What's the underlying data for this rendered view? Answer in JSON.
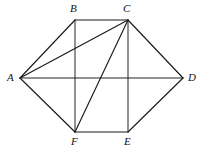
{
  "figure": {
    "name": "hexagon-with-diagonals",
    "width": 202,
    "height": 153,
    "background_color": "#ffffff",
    "stroke_color": "#1a1a1a",
    "vertices": [
      {
        "id": "A",
        "label": "A",
        "x": 20,
        "y": 78,
        "label_x": 7,
        "label_y": 72
      },
      {
        "id": "B",
        "label": "B",
        "x": 75,
        "y": 20,
        "label_x": 70,
        "label_y": 3
      },
      {
        "id": "C",
        "label": "C",
        "x": 128,
        "y": 20,
        "label_x": 123,
        "label_y": 3
      },
      {
        "id": "D",
        "label": "D",
        "x": 183,
        "y": 78,
        "label_x": 188,
        "label_y": 72
      },
      {
        "id": "E",
        "label": "E",
        "x": 128,
        "y": 132,
        "label_x": 124,
        "label_y": 136
      },
      {
        "id": "F",
        "label": "F",
        "x": 75,
        "y": 132,
        "label_x": 71,
        "label_y": 136
      }
    ],
    "edges": [
      {
        "id": "AB",
        "from": "A",
        "to": "B",
        "weight": "normal"
      },
      {
        "id": "BC",
        "from": "B",
        "to": "C",
        "weight": "normal"
      },
      {
        "id": "CD",
        "from": "C",
        "to": "D",
        "weight": "normal"
      },
      {
        "id": "DE",
        "from": "D",
        "to": "E",
        "weight": "normal"
      },
      {
        "id": "EF",
        "from": "E",
        "to": "F",
        "weight": "normal"
      },
      {
        "id": "FA",
        "from": "F",
        "to": "A",
        "weight": "normal"
      },
      {
        "id": "AC",
        "from": "A",
        "to": "C",
        "weight": "normal"
      },
      {
        "id": "AD",
        "from": "A",
        "to": "D",
        "weight": "thin"
      },
      {
        "id": "BF",
        "from": "B",
        "to": "F",
        "weight": "thin"
      },
      {
        "id": "CE",
        "from": "C",
        "to": "E",
        "weight": "thin"
      },
      {
        "id": "CF",
        "from": "C",
        "to": "F",
        "weight": "normal"
      }
    ]
  }
}
